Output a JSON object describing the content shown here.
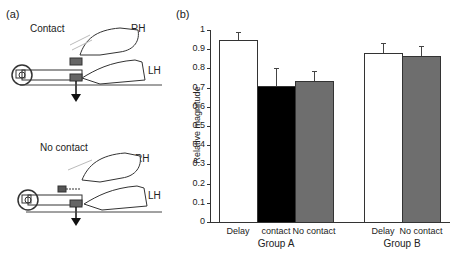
{
  "panel_a": {
    "label": "(a)",
    "top": {
      "condition": "Contact",
      "rh": "RH",
      "lh": "LH"
    },
    "bottom": {
      "condition": "No contact",
      "rh": "RH",
      "lh": "LH"
    }
  },
  "panel_b": {
    "label": "(b)"
  },
  "colors": {
    "white_bar": "#ffffff",
    "black_bar": "#000000",
    "gray_bar": "#6e6e6e"
  },
  "chart_data": {
    "type": "bar",
    "title": "",
    "ylabel": "Relative magnitude",
    "xlabel": "",
    "ylim": [
      0,
      1
    ],
    "yticks": [
      "0",
      "0.1",
      "0.2",
      "0.3",
      "0.4",
      "0.5",
      "0.6",
      "0.7",
      "0.8",
      "0.9",
      "1"
    ],
    "groups": [
      {
        "name": "Group A",
        "bars": [
          {
            "label": "Delay",
            "value": 0.95,
            "error_top": 0.99,
            "fill": "white"
          },
          {
            "label": "contact",
            "value": 0.71,
            "error_top": 0.8,
            "fill": "black"
          },
          {
            "label": "No contact",
            "value": 0.735,
            "error_top": 0.785,
            "fill": "gray"
          }
        ]
      },
      {
        "name": "Group B",
        "bars": [
          {
            "label": "Delay",
            "value": 0.88,
            "error_top": 0.93,
            "fill": "white"
          },
          {
            "label": "No contact",
            "value": 0.865,
            "error_top": 0.915,
            "fill": "gray"
          }
        ]
      }
    ],
    "grid": false,
    "legend": "none"
  }
}
